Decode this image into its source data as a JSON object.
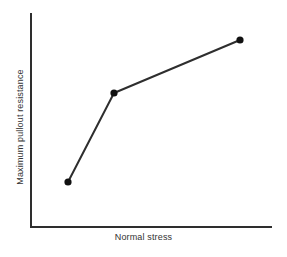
{
  "figure": {
    "background_color": "#ffffff",
    "ink_color": "#2e2e2e",
    "text_color": "#333333"
  },
  "chart_data": {
    "type": "line",
    "title": "",
    "subtitle": "",
    "xlabel": "Normal stress",
    "ylabel": "Maximum pullout resistance",
    "grid": false,
    "legend": null,
    "legend_position": "none",
    "annotations": [],
    "xticks": [],
    "yticks": [],
    "xticklabels": [],
    "yticklabels": [],
    "xlim": [
      0,
      1
    ],
    "ylim": [
      0,
      1
    ],
    "axis_style": "open-L (left and bottom spines only, no ticks, no tick labels)",
    "note": "Schematic/conceptual plot: axes are unlabeled with no numeric scale.",
    "series": [
      {
        "name": "Maximum pullout resistance",
        "marker": "filled-circle",
        "marker_color": "#111111",
        "line_color": "#2e2e2e",
        "line_width": 2,
        "x": [
          0.153,
          0.344,
          0.867
        ],
        "y": [
          0.21,
          0.626,
          0.874
        ],
        "points_px": [
          {
            "x": 68,
            "y": 182
          },
          {
            "x": 114,
            "y": 93
          },
          {
            "x": 240,
            "y": 40
          }
        ]
      }
    ]
  },
  "axes_geometry_px": {
    "origin_x": 31,
    "origin_y": 227,
    "y_axis_top": 13,
    "x_axis_right": 272,
    "spine_width": 2
  },
  "labels": {
    "x_axis": "Normal stress",
    "y_axis": "Maximum pullout resistance"
  }
}
